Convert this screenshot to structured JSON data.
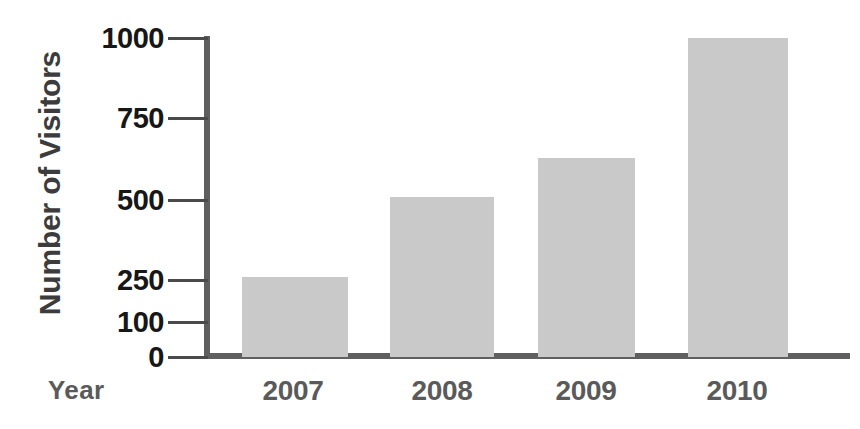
{
  "chart_data": {
    "type": "bar",
    "title": "",
    "xlabel": "Year",
    "ylabel": "Number of Visitors",
    "categories": [
      "2007",
      "2008",
      "2009",
      "2010"
    ],
    "values": [
      250,
      510,
      630,
      1000
    ],
    "series": [
      {
        "name": "Number of Visitors",
        "values": [
          250,
          510,
          630,
          1000
        ]
      }
    ],
    "ytick_labels": [
      "0",
      "100",
      "250",
      "500",
      "750",
      "1000"
    ],
    "ytick_values": [
      0,
      100,
      250,
      500,
      750,
      1000
    ],
    "ylim": [
      0,
      1000
    ],
    "axis_note": "non-linear (broken) y-axis spacing",
    "grid": false,
    "legend": false,
    "legend_position": "none",
    "colors": {
      "bar_fill": "#c9c9c9",
      "axis": "#5f5f5f",
      "tick_text": "#171717",
      "label_text": "#5a5a5a",
      "ylabel_text": "#3c3c3c",
      "background": "#ffffff"
    }
  },
  "geometry": {
    "ytick_y_px": [
      357,
      322,
      280,
      200,
      118,
      38
    ],
    "bars_px": [
      {
        "left": 242,
        "width": 106,
        "top": 277
      },
      {
        "left": 390,
        "width": 104,
        "top": 197
      },
      {
        "left": 538,
        "width": 97,
        "top": 158
      },
      {
        "left": 688,
        "width": 100,
        "top": 38
      }
    ],
    "xlabel_centers_px": [
      293,
      442,
      586,
      737
    ],
    "baseline_y_px": 357
  }
}
